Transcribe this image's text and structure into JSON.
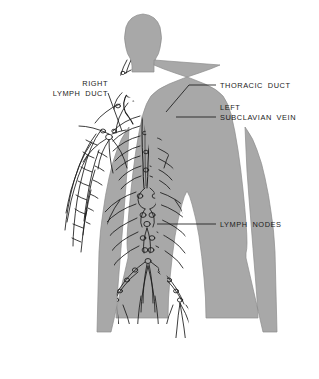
{
  "figure": {
    "background_color": "#ffffff",
    "body_fill_color": "#a8a8a8",
    "body_outline_color": "#6f6f6f",
    "vessel_color": "#1a1a1a",
    "node_color": "#1a1a1a",
    "leader_line_color": "#1b1b1b",
    "text_color": "#1b1b1b"
  },
  "labels": [
    {
      "id": "right-lymph-duct",
      "line1": "RIGHT",
      "line2": "LYMPH DUCT",
      "align": "right",
      "anchor_x": 108,
      "anchor_y": 88,
      "target_x": 122,
      "target_y": 131
    },
    {
      "id": "thoracic-duct",
      "line1": "THORACIC DUCT",
      "line2": "",
      "align": "left",
      "anchor_x": 218,
      "anchor_y": 85,
      "target_x": 166,
      "target_y": 112
    },
    {
      "id": "left-subclavian-vein",
      "line1": "LEFT",
      "line2": "SUBCLAVIAN VEIN",
      "align": "left",
      "anchor_x": 218,
      "anchor_y": 117,
      "target_x": 176,
      "target_y": 117
    },
    {
      "id": "lymph-nodes",
      "line1": "LYMPH NODES",
      "line2": "",
      "align": "left",
      "anchor_x": 218,
      "anchor_y": 224,
      "target_x": 157,
      "target_y": 224
    }
  ],
  "anatomy_regions": [
    {
      "name": "head",
      "description": "gray silhouette of head, no vessels drawn"
    },
    {
      "name": "neck",
      "description": "cervical lymphatic chains with small nodes"
    },
    {
      "name": "right-lymph-duct",
      "description": "short duct draining right upper body into right subclavian vein"
    },
    {
      "name": "thoracic-duct",
      "description": "long vertical duct ascending along spine to left subclavian vein"
    },
    {
      "name": "left-subclavian-vein",
      "description": "vein at left shoulder receiving thoracic duct"
    },
    {
      "name": "axillary-nodes",
      "description": "node clusters in both armpits with radiating vessels"
    },
    {
      "name": "intercostal-vessels",
      "description": "rib-following lymphatics branching off thoracic duct"
    },
    {
      "name": "cisterna-chyli",
      "description": "dilated lower end of thoracic duct in upper abdomen"
    },
    {
      "name": "lumbar-nodes",
      "description": "beaded chain of nodes along abdominal aorta"
    },
    {
      "name": "iliac-nodes",
      "description": "pelvic node chains branching into the groin"
    },
    {
      "name": "inguinal-nodes",
      "description": "node clusters at both groins"
    },
    {
      "name": "arm-vessels",
      "description": "feathery superficial lymphatics descending both arms"
    },
    {
      "name": "thigh-vessels",
      "description": "superficial lymphatics descending both thighs"
    }
  ]
}
